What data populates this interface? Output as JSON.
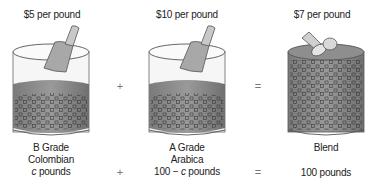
{
  "containers": [
    {
      "price": "$5 per pound",
      "grade": "B Grade",
      "variety": "Colombian",
      "amount_var": "c",
      "amount_suffix": " pounds"
    },
    {
      "price": "$10 per pound",
      "grade": "A Grade",
      "variety": "Arabica",
      "amount_prefix": "100 − ",
      "amount_var": "c",
      "amount_suffix": " pounds"
    },
    {
      "price": "$7 per pound",
      "grade": "Blend",
      "amount": "100 pounds"
    }
  ],
  "operators": {
    "plus": "+",
    "equals": "="
  },
  "colors": {
    "coffee": "#8a8a8a",
    "coffee_dark": "#6e6e6e",
    "glass": "#f4f4f4",
    "outline": "#555555",
    "scoop": "#9a9a9a",
    "bean": "#3a3a3a"
  }
}
